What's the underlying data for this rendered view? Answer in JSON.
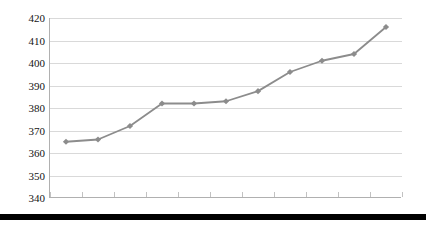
{
  "chart_data": {
    "type": "line",
    "title": "",
    "subtitle": "",
    "xlabel": "",
    "ylabel": "",
    "categories": [
      "1999",
      "2000",
      "2001",
      "2002",
      "2003",
      "2004",
      "2005",
      "2006",
      "2007",
      "2008",
      "2009"
    ],
    "values": [
      365,
      366,
      372,
      382,
      382,
      383,
      387.5,
      396,
      401,
      404,
      416
    ],
    "series": [
      {
        "name": "",
        "values": [
          365,
          366,
          372,
          382,
          382,
          383,
          387.5,
          396,
          401,
          404,
          416
        ]
      }
    ],
    "ylim": [
      340,
      420
    ],
    "yticks": [
      340,
      350,
      360,
      370,
      380,
      390,
      400,
      410,
      420
    ],
    "ytick_labels": [
      "340",
      "350",
      "360",
      "370",
      "380",
      "390",
      "400",
      "410",
      "420"
    ],
    "xtick_labels": [
      "1999",
      "2000",
      "2001",
      "2002",
      "2003",
      "2004",
      "2005",
      "2006",
      "2007",
      "2008",
      "2009"
    ],
    "grid": true,
    "grid_axis": "y",
    "legend": false,
    "legend_position": "none",
    "marker": "diamond",
    "annotations": []
  },
  "style": {
    "series_color": "#8c8c8c",
    "marker_color": "#8c8c8c",
    "grid_color": "#d9d9d9",
    "axis_color": "#b0b0b0",
    "text_color": "#141414",
    "background": "#ffffff",
    "footer_bar_color": "#000000"
  }
}
